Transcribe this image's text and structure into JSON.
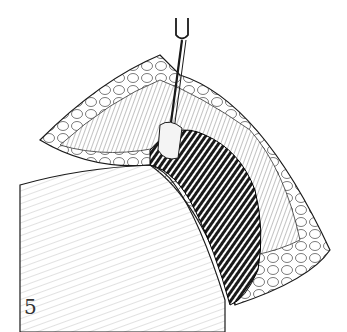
{
  "figure": {
    "number": "5",
    "colors": {
      "ink": "#1a1a1a",
      "background": "#ffffff",
      "hatch": "#555555"
    }
  }
}
